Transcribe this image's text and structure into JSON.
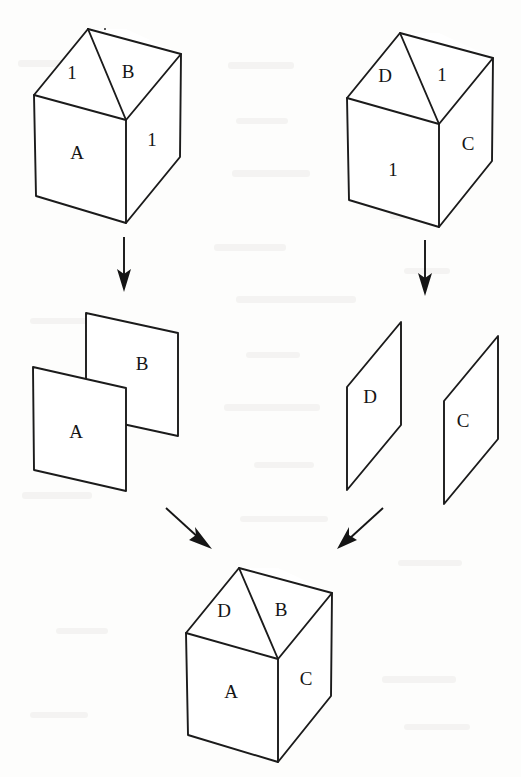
{
  "figure": {
    "background_color": "#fdfdfc",
    "ink_color": "#1b1b1b",
    "stage_count": 3
  },
  "stages": [
    {
      "id": "stage-top",
      "name": "source-cubes",
      "items": [
        {
          "id": "cube-top-left",
          "kind": "open-cube",
          "faces": [
            {
              "position": "top-left",
              "label": "1"
            },
            {
              "position": "top-right",
              "label": "B"
            },
            {
              "position": "front-left",
              "label": "A"
            },
            {
              "position": "front-right",
              "label": "1"
            }
          ]
        },
        {
          "id": "cube-top-right",
          "kind": "open-cube",
          "faces": [
            {
              "position": "top-left",
              "label": "D"
            },
            {
              "position": "top-right",
              "label": "1"
            },
            {
              "position": "front-left",
              "label": "1"
            },
            {
              "position": "front-right",
              "label": "C"
            }
          ]
        }
      ]
    },
    {
      "id": "stage-middle",
      "name": "extracted-panels",
      "items": [
        {
          "id": "panel-group-left",
          "kind": "panel-pair-overlapping",
          "panels": [
            {
              "id": "panel-a",
              "label": "A",
              "depth": "front"
            },
            {
              "id": "panel-b",
              "label": "B",
              "depth": "back"
            }
          ]
        },
        {
          "id": "panel-group-right",
          "kind": "panel-pair-separate",
          "panels": [
            {
              "id": "panel-d",
              "label": "D",
              "depth": "left"
            },
            {
              "id": "panel-c",
              "label": "C",
              "depth": "right"
            }
          ]
        }
      ]
    },
    {
      "id": "stage-bottom",
      "name": "assembled-cube",
      "items": [
        {
          "id": "cube-result",
          "kind": "open-cube",
          "faces": [
            {
              "position": "top-left",
              "label": "D"
            },
            {
              "position": "top-right",
              "label": "B"
            },
            {
              "position": "front-left",
              "label": "A"
            },
            {
              "position": "front-right",
              "label": "C"
            }
          ]
        }
      ]
    }
  ],
  "arrows": [
    {
      "id": "arrow-left-down",
      "direction": "down",
      "from": "cube-top-left",
      "to": "panel-group-left"
    },
    {
      "id": "arrow-right-down",
      "direction": "down",
      "from": "cube-top-right",
      "to": "panel-group-right"
    },
    {
      "id": "arrow-left-diag",
      "direction": "down-right",
      "from": "panel-group-left",
      "to": "cube-result"
    },
    {
      "id": "arrow-right-diag",
      "direction": "down-left",
      "from": "panel-group-right",
      "to": "cube-result"
    }
  ],
  "labels": {
    "cube_tl_top_left": "1",
    "cube_tl_top_right": "B",
    "cube_tl_front_left": "A",
    "cube_tl_front_right": "1",
    "cube_tr_top_left": "D",
    "cube_tr_top_right": "1",
    "cube_tr_front_left": "1",
    "cube_tr_front_right": "C",
    "panel_a": "A",
    "panel_b": "B",
    "panel_d": "D",
    "panel_c": "C",
    "cube_res_top_left": "D",
    "cube_res_top_right": "B",
    "cube_res_front_left": "A",
    "cube_res_front_right": "C"
  }
}
